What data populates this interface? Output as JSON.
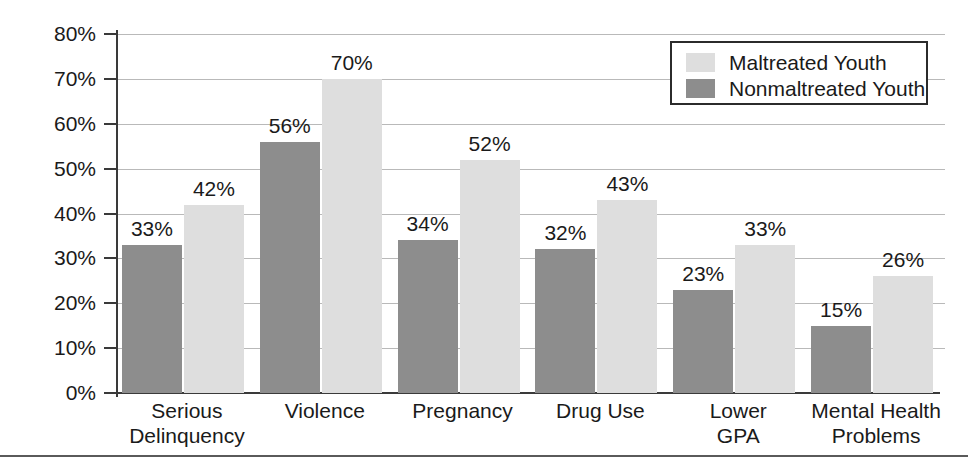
{
  "chart_data": {
    "type": "bar",
    "title": "",
    "subtitle": "",
    "xlabel": "",
    "ylabel": "",
    "categories": [
      "Serious\nDelinquency",
      "Violence",
      "Pregnancy",
      "Drug Use",
      "Lower\nGPA",
      "Mental Health\nProblems"
    ],
    "series": [
      {
        "name": "Nonmaltreated Youth",
        "color": "#8d8d8d",
        "values": [
          33,
          56,
          34,
          32,
          23,
          15
        ],
        "value_labels": [
          "33%",
          "56%",
          "34%",
          "32%",
          "23%",
          "15%"
        ]
      },
      {
        "name": "Maltreated Youth",
        "color": "#dedede",
        "values": [
          42,
          70,
          52,
          43,
          33,
          26
        ],
        "value_labels": [
          "42%",
          "70%",
          "52%",
          "43%",
          "33%",
          "26%"
        ]
      }
    ],
    "ylim": [
      0,
      80
    ],
    "ytick_values": [
      0,
      10,
      20,
      30,
      40,
      50,
      60,
      70,
      80
    ],
    "ytick_labels": [
      "0%",
      "10%",
      "20%",
      "30%",
      "40%",
      "50%",
      "60%",
      "70%",
      "80%"
    ],
    "grid": true,
    "legend_position": "top-right",
    "legend_entries": [
      {
        "label": "Maltreated Youth",
        "swatch": "light"
      },
      {
        "label": "Nonmaltreated Youth",
        "swatch": "dark"
      }
    ]
  }
}
